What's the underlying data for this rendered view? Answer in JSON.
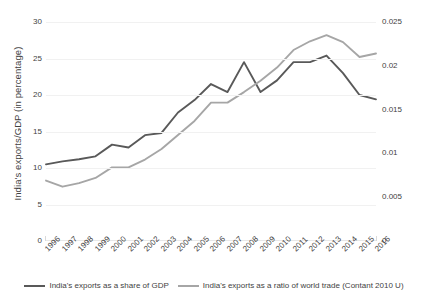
{
  "chart_data": {
    "type": "line",
    "title": "",
    "xlabel": "",
    "ylabel": "India's exports/GDP (in percentage)",
    "y2label": "Ratio of India's exports/world trade (constant 2010 USD)",
    "grid": true,
    "legend_position": "bottom",
    "categories": [
      "1996",
      "1997",
      "1998",
      "1999",
      "2000",
      "2001",
      "2002",
      "2003",
      "2004",
      "2005",
      "2006",
      "2007",
      "2008",
      "2009",
      "2010",
      "2011",
      "2012",
      "2013",
      "2014",
      "2015",
      "2016"
    ],
    "ylim": [
      0,
      30
    ],
    "yticks": [
      0,
      5,
      10,
      15,
      20,
      25,
      30
    ],
    "ytick_labels": [
      "0",
      "5",
      "10",
      "15",
      "20",
      "25",
      "30"
    ],
    "y2lim": [
      0,
      0.025
    ],
    "y2ticks": [
      0,
      0.005,
      0.01,
      0.015,
      0.02,
      0.025
    ],
    "y2tick_labels": [
      "0",
      "0.005",
      "0.01",
      "0.015",
      "0.02",
      "0.025"
    ],
    "series": [
      {
        "name": "India's exports as a share of GDP",
        "axis": "left",
        "color": "#595959",
        "values": [
          10.5,
          10.9,
          11.2,
          11.6,
          13.2,
          12.8,
          14.5,
          14.8,
          17.6,
          19.3,
          21.5,
          20.4,
          24.5,
          20.4,
          22.0,
          24.5,
          24.5,
          25.4,
          23.0,
          20.0,
          19.4
        ]
      },
      {
        "name": "India's exports as a ratio of world trade (Contant 2010 U)",
        "axis": "right",
        "color": "#a6a6a6",
        "values": [
          0.0069,
          0.0062,
          0.0066,
          0.0072,
          0.0084,
          0.0084,
          0.0093,
          0.0105,
          0.0121,
          0.0137,
          0.0158,
          0.0158,
          0.017,
          0.0183,
          0.0198,
          0.0218,
          0.0228,
          0.0235,
          0.0227,
          0.021,
          0.0214
        ]
      }
    ]
  },
  "axes": {
    "y_left_title": "India's exports/GDP (in percentage)",
    "y_right_title": "Ratio of India's exports/world trade (constant 2010 USD)"
  },
  "legend": {
    "items": [
      {
        "label": "India's exports as a share of GDP",
        "color": "#595959"
      },
      {
        "label": "India's exports as a ratio of world trade (Contant 2010 U)",
        "color": "#a6a6a6"
      }
    ]
  }
}
